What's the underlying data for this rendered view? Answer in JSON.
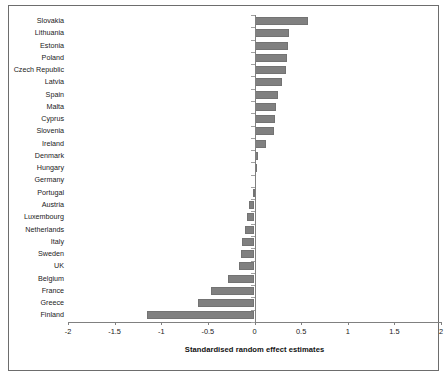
{
  "chart_data": {
    "type": "bar",
    "orientation": "horizontal",
    "title": "",
    "xlabel": "Standardised random effect estimates",
    "ylabel": "",
    "xlim": [
      -2,
      2
    ],
    "xticks": [
      "-2",
      "-1.5",
      "-1",
      "-0.5",
      "0",
      "0.5",
      "1",
      "1.5",
      "2"
    ],
    "xtick_values": [
      -2,
      -1.5,
      -1,
      -0.5,
      0,
      0.5,
      1,
      1.5,
      2
    ],
    "grid": false,
    "legend": null,
    "bar_color": "#808080",
    "bar_edge_color": "#737373",
    "axis_color": "#808080",
    "categories": [
      "Slovakia",
      "Lithuania",
      "Estonia",
      "Poland",
      "Czech Republic",
      "Latvia",
      "Spain",
      "Malta",
      "Cyprus",
      "Slovenia",
      "Ireland",
      "Denmark",
      "Hungary",
      "Germany",
      "Portugal",
      "Austria",
      "Luxembourg",
      "Netherlands",
      "Italy",
      "Sweden",
      "UK",
      "Belgium",
      "France",
      "Greece",
      "Finland"
    ],
    "values": [
      0.57,
      0.37,
      0.36,
      0.35,
      0.34,
      0.29,
      0.25,
      0.23,
      0.22,
      0.21,
      0.12,
      0.04,
      0.01,
      0.0,
      -0.02,
      -0.06,
      -0.08,
      -0.1,
      -0.13,
      -0.15,
      -0.17,
      -0.28,
      -0.47,
      -0.61,
      -1.15
    ]
  }
}
